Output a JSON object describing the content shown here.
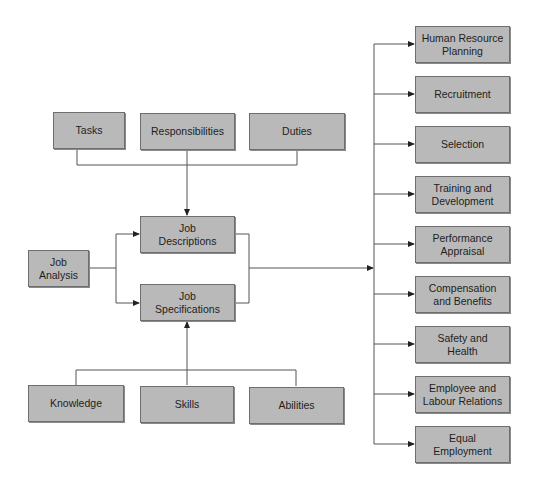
{
  "diagram": {
    "colors": {
      "box_fill": "#b9b9b9",
      "box_border": "#6e6e6e",
      "line": "#555555",
      "text": "#1e1e1e"
    },
    "top_inputs": [
      {
        "label": "Tasks"
      },
      {
        "label": "Responsibilities"
      },
      {
        "label": "Duties"
      }
    ],
    "source": {
      "line1": "Job",
      "line2": "Analysis"
    },
    "outputs": [
      {
        "line1": "Job",
        "line2": "Descriptions"
      },
      {
        "line1": "Job",
        "line2": "Specifications"
      }
    ],
    "bottom_inputs": [
      {
        "label": "Knowledge"
      },
      {
        "label": "Skills"
      },
      {
        "label": "Abilities"
      }
    ],
    "hr_functions": [
      {
        "line1": "Human Resource",
        "line2": "Planning"
      },
      {
        "line1": "Recruitment",
        "line2": ""
      },
      {
        "line1": "Selection",
        "line2": ""
      },
      {
        "line1": "Training and",
        "line2": "Development"
      },
      {
        "line1": "Performance",
        "line2": "Appraisal"
      },
      {
        "line1": "Compensation",
        "line2": "and Benefits"
      },
      {
        "line1": "Safety and",
        "line2": "Health"
      },
      {
        "line1": "Employee and",
        "line2": "Labour Relations"
      },
      {
        "line1": "Equal",
        "line2": "Employment"
      }
    ]
  }
}
